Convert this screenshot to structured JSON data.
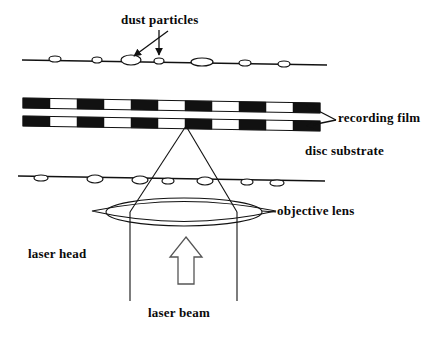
{
  "figure": {
    "kind": "optical-disc-cross-section-diagram",
    "background_color": "#ffffff",
    "ink_color": "#111111",
    "film_fill_color": "#111111",
    "film_gap_color": "#ffffff"
  },
  "labels": {
    "dust_particles": "dust particles",
    "recording_film": "recording film",
    "disc_substrate": "disc substrate",
    "objective_lens": "objective lens",
    "laser_head": "laser head",
    "laser_beam": "laser beam"
  },
  "geometry": {
    "top_surface": {
      "x1": 22,
      "y1": 60,
      "x2": 327,
      "y2": 65
    },
    "bottom_surface": {
      "x1": 18,
      "y1": 176,
      "x2": 325,
      "y2": 181
    },
    "film_upper_band": {
      "x1": 23,
      "y_left": 98,
      "x2": 320,
      "y_right": 103,
      "thickness": 10
    },
    "film_lower_band": {
      "x1": 23,
      "y_left": 116,
      "x2": 320,
      "y_right": 121,
      "thickness": 10
    },
    "film_segment_count": 11,
    "focus_point": {
      "x": 186,
      "y": 126
    },
    "cone_left_at_lens": {
      "x": 130,
      "y": 212
    },
    "cone_right_at_lens": {
      "x": 237,
      "y": 212
    },
    "lens_center": {
      "x": 184,
      "y": 212
    },
    "lens_half_width": 92,
    "lens_half_height": 14,
    "beam_left_x": 130,
    "beam_right_x": 237,
    "beam_bottom_y": 301,
    "up_arrow": {
      "cx": 186,
      "top_y": 237,
      "bottom_y": 284,
      "shaft_half_width": 8,
      "head_half_width": 16
    }
  },
  "top_dust_particles": [
    {
      "cx": 55,
      "cy": 59,
      "rx": 6,
      "ry": 3
    },
    {
      "cx": 97,
      "cy": 60,
      "rx": 5,
      "ry": 3
    },
    {
      "cx": 131,
      "cy": 60,
      "rx": 10,
      "ry": 5
    },
    {
      "cx": 159,
      "cy": 61,
      "rx": 5,
      "ry": 3
    },
    {
      "cx": 202,
      "cy": 62,
      "rx": 11,
      "ry": 4
    },
    {
      "cx": 245,
      "cy": 63,
      "rx": 6,
      "ry": 3
    },
    {
      "cx": 284,
      "cy": 64,
      "rx": 6,
      "ry": 3
    }
  ],
  "bottom_surface_marks": [
    {
      "cx": 41,
      "cy": 178,
      "rx": 7,
      "ry": 3
    },
    {
      "cx": 95,
      "cy": 179,
      "rx": 8,
      "ry": 4
    },
    {
      "cx": 140,
      "cy": 180,
      "rx": 8,
      "ry": 4
    },
    {
      "cx": 168,
      "cy": 181,
      "rx": 6,
      "ry": 3
    },
    {
      "cx": 205,
      "cy": 181,
      "rx": 8,
      "ry": 4
    },
    {
      "cx": 247,
      "cy": 182,
      "rx": 6,
      "ry": 3
    },
    {
      "cx": 277,
      "cy": 183,
      "rx": 7,
      "ry": 3
    }
  ],
  "callouts": {
    "dust_arrow_diagonal": {
      "x1": 168,
      "y1": 31,
      "x2": 134,
      "y2": 56
    },
    "dust_arrow_vertical": {
      "x1": 159,
      "y1": 30,
      "x2": 159,
      "y2": 55
    },
    "recording_film_upper_arrow": {
      "x1": 336,
      "y1": 120,
      "x2": 307,
      "y2": 105
    },
    "recording_film_lower_arrow": {
      "x1": 336,
      "y1": 120,
      "x2": 307,
      "y2": 126
    },
    "objective_lens_pointer": {
      "x1": 276,
      "y1": 212,
      "x2": 262,
      "y2": 211
    }
  }
}
